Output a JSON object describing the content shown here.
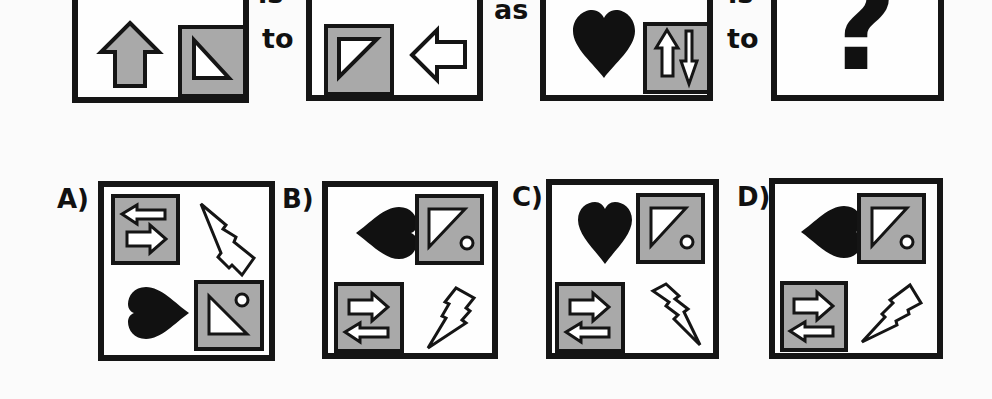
{
  "puzzle": {
    "type": "visual-analogy",
    "connectors": {
      "is_1": "is",
      "to_1": "to",
      "as": "as",
      "is_2": "is",
      "to_2": "to"
    },
    "question_mark": "?",
    "colors": {
      "stroke": "#151515",
      "gray_fill": "#a9a9a9",
      "background": "#fbfbfb"
    },
    "top_row": [
      {
        "id": "panel-1",
        "visible_items": [
          "gray-rect-top-left",
          "up-arrow-gray",
          "gray-square-with-right-triangle"
        ]
      },
      {
        "id": "panel-2",
        "visible_items": [
          "black-rect-top-left",
          "gray-rect-top-right",
          "gray-square-with-triangle",
          "left-arrow-outline"
        ]
      },
      {
        "id": "panel-3",
        "visible_items": [
          "gray-rect-top-left",
          "black-heart",
          "gray-square-with-up-down-arrows"
        ]
      },
      {
        "id": "panel-4",
        "visible_items": [
          "question-mark"
        ]
      }
    ]
  },
  "options": [
    {
      "label": "A)",
      "items": [
        "gray-square-with-left-right-arrows",
        "lightning-bolt",
        "black-heart",
        "gray-square-with-triangle-and-circle"
      ]
    },
    {
      "label": "B)",
      "items": [
        "black-heart",
        "gray-square-with-triangle-and-circle",
        "gray-square-with-right-left-arrows",
        "lightning-bolt"
      ]
    },
    {
      "label": "C)",
      "items": [
        "black-heart",
        "gray-square-with-triangle-and-circle",
        "gray-square-with-right-left-arrows",
        "lightning-bolt"
      ]
    },
    {
      "label": "D)",
      "items": [
        "black-heart",
        "gray-square-with-triangle-and-circle",
        "gray-square-with-right-left-arrows",
        "lightning-bolt"
      ]
    }
  ]
}
